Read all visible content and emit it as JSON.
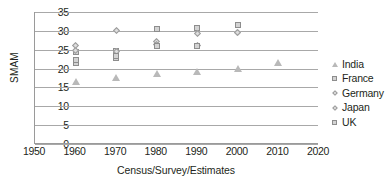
{
  "chart_data": {
    "type": "scatter",
    "title": "",
    "xlabel": "Census/Survey/Estimates",
    "ylabel": "SMAM",
    "xlim": [
      1950,
      2020
    ],
    "ylim": [
      0,
      35
    ],
    "xticks": [
      1950,
      1960,
      1970,
      1980,
      1990,
      2000,
      2010,
      2020
    ],
    "yticks": [
      0,
      5,
      10,
      15,
      20,
      25,
      30,
      35
    ],
    "grid": "horizontal",
    "legend_position": "right",
    "series": [
      {
        "name": "India",
        "marker": "triangle",
        "color": "#b9b9b9",
        "points": [
          {
            "x": 1960,
            "y": 16.6
          },
          {
            "x": 1970,
            "y": 17.7
          },
          {
            "x": 1980,
            "y": 18.7
          },
          {
            "x": 1990,
            "y": 19.3
          },
          {
            "x": 2000,
            "y": 20.0
          },
          {
            "x": 2010,
            "y": 21.5
          }
        ]
      },
      {
        "name": "France",
        "marker": "square",
        "color": "#d3d3d3",
        "points": [
          {
            "x": 1960,
            "y": 24.4
          },
          {
            "x": 1970,
            "y": 24.6
          },
          {
            "x": 1980,
            "y": 30.5
          },
          {
            "x": 1990,
            "y": 30.8
          },
          {
            "x": 2000,
            "y": 31.5
          }
        ]
      },
      {
        "name": "Germany",
        "marker": "diamond",
        "color": "#dedede",
        "points": [
          {
            "x": 1960,
            "y": 26.2
          },
          {
            "x": 1970,
            "y": 30.0
          },
          {
            "x": 1980,
            "y": 27.2
          },
          {
            "x": 1990,
            "y": 29.4
          },
          {
            "x": 2000,
            "y": 29.5
          }
        ]
      },
      {
        "name": "Japan",
        "marker": "diamond",
        "color": "#dedede",
        "points": [
          {
            "x": 1960,
            "y": 24.8
          },
          {
            "x": 1970,
            "y": 24.4
          },
          {
            "x": 1980,
            "y": 26.5
          },
          {
            "x": 1990,
            "y": 26.1
          },
          {
            "x": 2000,
            "y": 29.5
          }
        ]
      },
      {
        "name": "UK",
        "marker": "square",
        "color": "#d3d3d3",
        "points": [
          {
            "x": 1960,
            "y": 21.6
          },
          {
            "x": 1960,
            "y": 22.3
          },
          {
            "x": 1970,
            "y": 22.8
          },
          {
            "x": 1970,
            "y": 23.4
          },
          {
            "x": 1980,
            "y": 26.1
          },
          {
            "x": 1990,
            "y": 26.1
          },
          {
            "x": 2000,
            "y": 31.5
          }
        ]
      }
    ]
  },
  "legend": {
    "items": [
      {
        "label": "India",
        "marker": "triangle"
      },
      {
        "label": "France",
        "marker": "square"
      },
      {
        "label": "Germany",
        "marker": "diamond"
      },
      {
        "label": "Japan",
        "marker": "diamond"
      },
      {
        "label": "UK",
        "marker": "square"
      }
    ]
  }
}
